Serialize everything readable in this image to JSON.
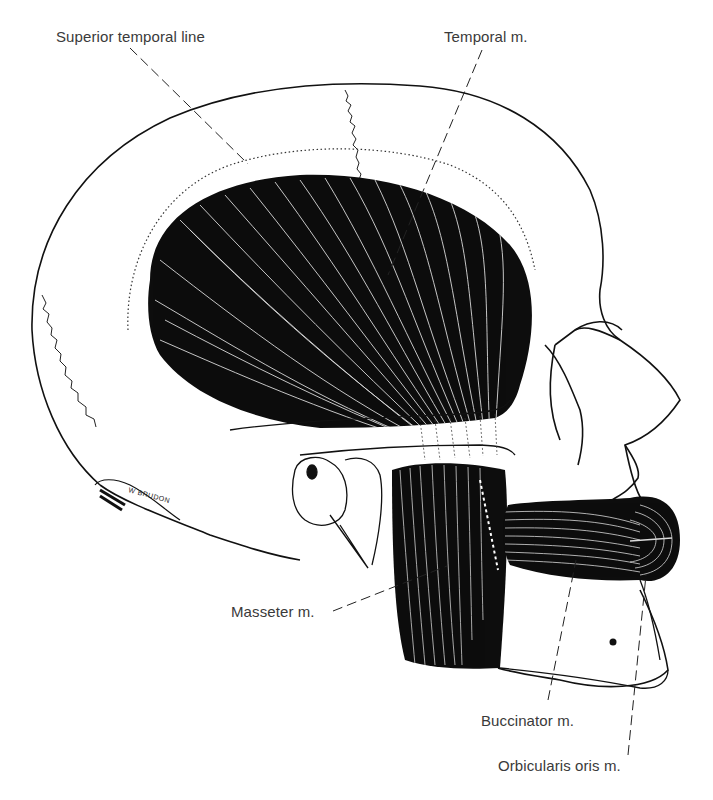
{
  "figure": {
    "signature": "W BRUDON",
    "colors": {
      "ink": "#111111",
      "label": "#3a3a3a",
      "paper": "#ffffff"
    }
  },
  "labels": [
    {
      "id": "superior-temporal-line",
      "text": "Superior temporal line"
    },
    {
      "id": "temporal-muscle",
      "text": "Temporal m."
    },
    {
      "id": "masseter-muscle",
      "text": "Masseter m."
    },
    {
      "id": "buccinator-muscle",
      "text": "Buccinator m."
    },
    {
      "id": "orbicularis-oris-muscle",
      "text": "Orbicularis oris m."
    }
  ]
}
